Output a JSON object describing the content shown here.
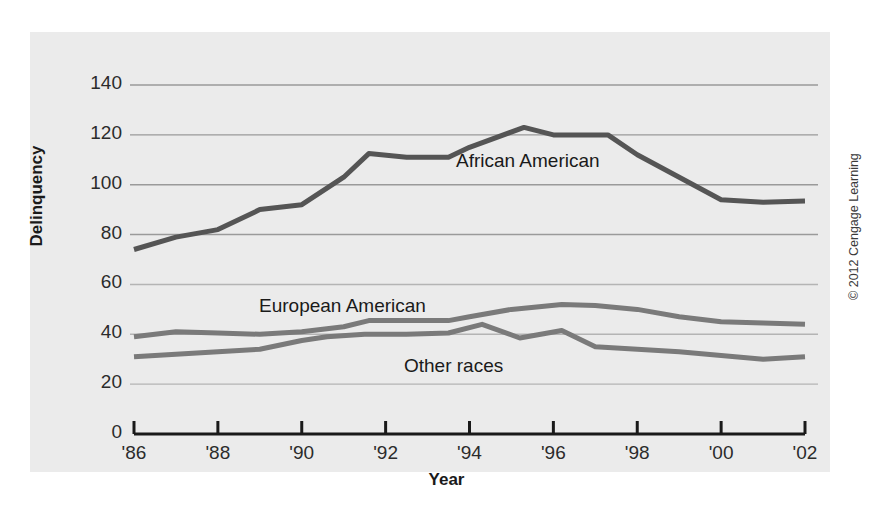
{
  "figure": {
    "background": "#ffffff",
    "panel_color": "#ebebeb",
    "copyright": "© 2012 Cengage Learning"
  },
  "labels": {
    "y_axis": "Delinquency",
    "x_axis": "Year",
    "african_american": "African American",
    "european_american": "European American",
    "other_races": "Other races"
  },
  "chart_data": {
    "type": "line",
    "title": "",
    "xlabel": "Year",
    "ylabel": "Delinquency",
    "xlim": [
      1986,
      2002
    ],
    "ylim": [
      0,
      150
    ],
    "grid": true,
    "grid_values": [
      20,
      40,
      60,
      80,
      100,
      120,
      140
    ],
    "legend_position": "inline-annotations",
    "x_tick_labels": [
      "'86",
      "'88",
      "'90",
      "'92",
      "'94",
      "'96",
      "'98",
      "'00",
      "'02"
    ],
    "x_tick_values": [
      1986,
      1988,
      1990,
      1992,
      1994,
      1996,
      1998,
      2000,
      2002
    ],
    "y_tick_labels": [
      "0",
      "20",
      "40",
      "60",
      "80",
      "100",
      "120",
      "140"
    ],
    "y_tick_values": [
      0,
      20,
      40,
      60,
      80,
      100,
      120,
      140
    ],
    "series": [
      {
        "name": "African American",
        "color": "#555555",
        "linewidth": 5,
        "x": [
          1986,
          1987,
          1988,
          1989,
          1990,
          1991,
          1991.6,
          1992.5,
          1993.5,
          1994,
          1995.3,
          1996,
          1997,
          1997.3,
          1998,
          1999,
          2000,
          2001,
          2002
        ],
        "y": [
          74,
          79,
          82,
          90,
          92,
          103,
          112.5,
          111,
          111,
          115,
          123,
          120,
          120,
          120,
          112,
          103,
          94,
          93,
          93.5
        ]
      },
      {
        "name": "European American",
        "color": "#7a7a7a",
        "linewidth": 5,
        "x": [
          1986,
          1987,
          1988,
          1989,
          1990,
          1991,
          1991.6,
          1992.5,
          1993.5,
          1994,
          1995,
          1996.2,
          1997,
          1998,
          1999,
          2000,
          2001,
          2002
        ],
        "y": [
          39,
          41,
          40.5,
          40,
          41,
          43,
          45.5,
          45.5,
          45.5,
          47,
          50,
          52,
          51.5,
          50,
          47,
          45,
          44.5,
          44
        ]
      },
      {
        "name": "Other races",
        "color": "#7a7a7a",
        "linewidth": 5,
        "x": [
          1986,
          1987,
          1988,
          1989,
          1990,
          1990.6,
          1991.5,
          1992.5,
          1993.5,
          1994.3,
          1995.2,
          1996.2,
          1997,
          1998,
          1999,
          2000,
          2001,
          2002
        ],
        "y": [
          31,
          32,
          33,
          34,
          37.5,
          39,
          40,
          40,
          40.5,
          44,
          38.5,
          41.5,
          35,
          34,
          33,
          31.5,
          30,
          31
        ]
      }
    ]
  }
}
